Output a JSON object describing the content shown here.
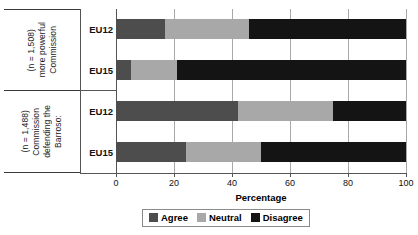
{
  "chart_data": {
    "type": "bar",
    "orientation": "horizontal",
    "stacked": true,
    "title": "",
    "xlabel": "Percentage",
    "ylabel": "",
    "xlim": [
      0,
      100
    ],
    "xticks": [
      0,
      20,
      40,
      60,
      80,
      100
    ],
    "grid": "vertical",
    "legend_position": "bottom",
    "categories": [
      "EU12",
      "EU15",
      "EU12",
      "EU15"
    ],
    "groups": [
      {
        "label": "Commission more powerful (n = 1,508)",
        "label_lines": [
          "Commission",
          "more powerful",
          "(n = 1,508)"
        ],
        "rows": [
          {
            "category": "EU12",
            "Agree": 17,
            "Neutral": 29,
            "Disagree": 54
          },
          {
            "category": "EU15",
            "Agree": 5,
            "Neutral": 16,
            "Disagree": 79
          }
        ]
      },
      {
        "label": "Barroso: defending the Commission (n = 1,488)",
        "label_lines": [
          "Barroso:",
          "defending the",
          "Commission",
          "(n = 1,488)"
        ],
        "rows": [
          {
            "category": "EU12",
            "Agree": 42,
            "Neutral": 33,
            "Disagree": 25
          },
          {
            "category": "EU15",
            "Agree": 24,
            "Neutral": 26,
            "Disagree": 50
          }
        ]
      }
    ],
    "series": [
      {
        "name": "Agree",
        "color": "#4d4d4d",
        "values": [
          17,
          5,
          42,
          24
        ]
      },
      {
        "name": "Neutral",
        "color": "#a8a8a8",
        "values": [
          29,
          16,
          33,
          26
        ]
      },
      {
        "name": "Disagree",
        "color": "#141414",
        "values": [
          54,
          79,
          25,
          50
        ]
      }
    ],
    "legend": [
      {
        "label": "Agree",
        "color": "#4d4d4d"
      },
      {
        "label": "Neutral",
        "color": "#a8a8a8"
      },
      {
        "label": "Disagree",
        "color": "#141414"
      }
    ]
  },
  "axis": {
    "x_tick_labels": [
      "0",
      "20",
      "40",
      "60",
      "80",
      "100"
    ],
    "x_title": "Percentage"
  },
  "groups": {
    "g0": {
      "l0": "Commission",
      "l1": "more powerful",
      "l2": "(n = 1,508)"
    },
    "g1": {
      "l0": "Barroso:",
      "l1": "defending the",
      "l2": "Commission",
      "l3": "(n = 1,488)"
    }
  },
  "cat_labels": {
    "r0": "EU12",
    "r1": "EU15",
    "r2": "EU12",
    "r3": "EU15"
  },
  "legend": {
    "agree": "Agree",
    "neutral": "Neutral",
    "disagree": "Disagree"
  }
}
